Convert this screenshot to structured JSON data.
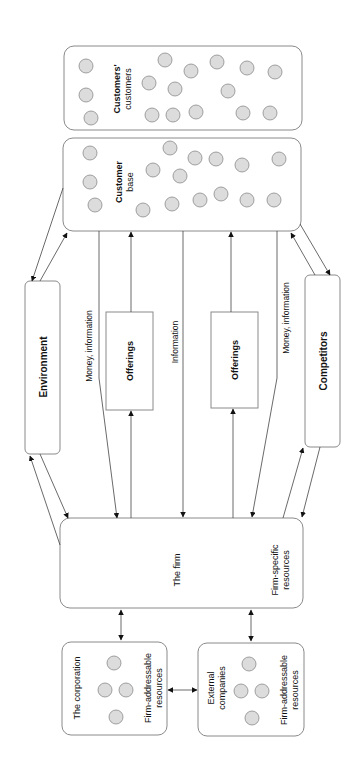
{
  "diagram": {
    "orientation": "rotated-90-ccw",
    "nodes": {
      "customers_customers": {
        "label_line1": "Customers'",
        "label_line2": "customers"
      },
      "customer_base": {
        "label_line1": "Customer",
        "label_line2": "base"
      },
      "environment": {
        "label": "Environment"
      },
      "offerings_1": {
        "label": "Offerings"
      },
      "offerings_2": {
        "label": "Offerings"
      },
      "competitors": {
        "label": "Competitors"
      },
      "the_firm": {
        "label": "The firm",
        "sub_line1": "Firm-specific",
        "sub_line2": "resources"
      },
      "corporation": {
        "label": "The corporation",
        "sub_line1": "Firm-addressable",
        "sub_line2": "resources"
      },
      "external": {
        "label_line1": "External",
        "label_line2": "companies",
        "sub_line1": "Firm-addressable",
        "sub_line2": "resources"
      }
    },
    "edge_labels": {
      "money_info_1": "Money, information",
      "information": "Information",
      "money_info_2": "Money, information"
    }
  }
}
